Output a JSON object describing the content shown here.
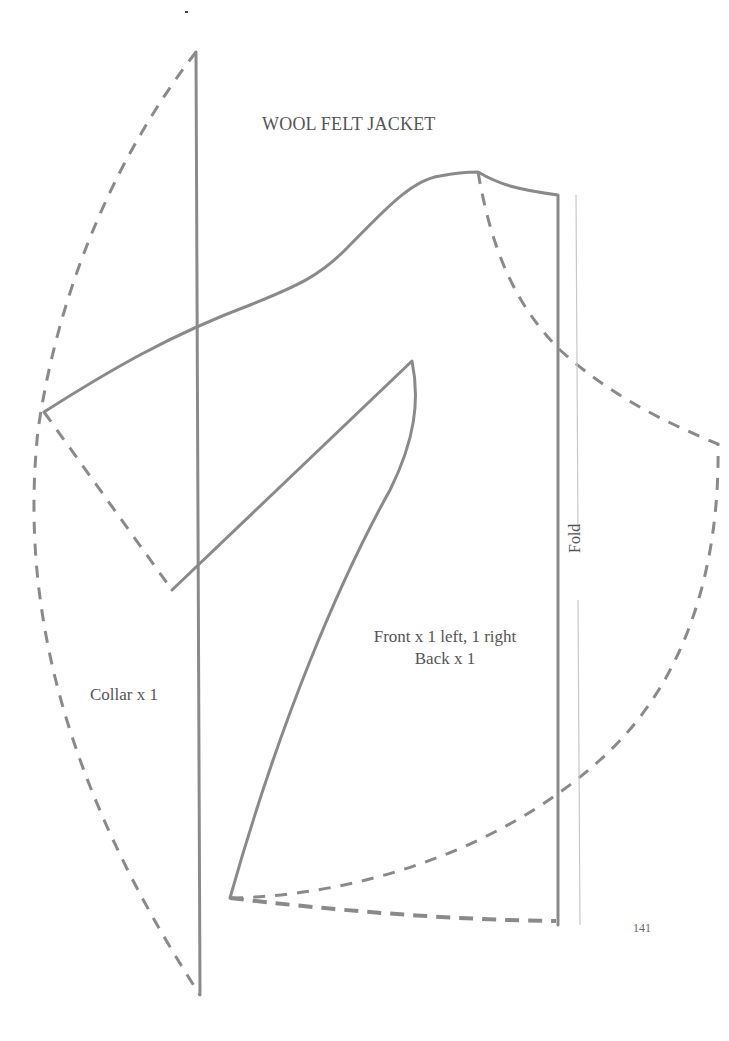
{
  "page": {
    "title": "WOOL FELT JACKET",
    "page_number": "141",
    "colors": {
      "line": "#8a8a8a",
      "fold_line": "#c8c8c8",
      "text": "#555555",
      "background": "#ffffff"
    }
  },
  "pieces": {
    "front_back": {
      "label_line1": "Front x 1 left, 1 right",
      "label_line2": "Back x 1"
    },
    "collar": {
      "label": "Collar x 1"
    }
  },
  "fold": {
    "label": "Fold"
  },
  "legend": {
    "solid_line": "cut line",
    "dashed_line": "alternate / collar line"
  }
}
